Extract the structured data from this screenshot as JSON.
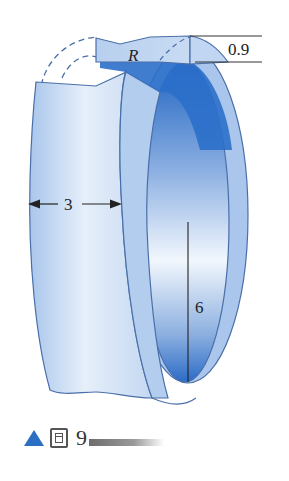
{
  "figure": {
    "labels": {
      "radius": "R",
      "thickness": "0.9",
      "width": "3",
      "height": "6"
    },
    "colors": {
      "outer_surface_light": "#e9f1fb",
      "outer_surface_mid": "#b9d0ee",
      "rim": "#a9c5eb",
      "inner_dark": "#2b6fca",
      "inner_light": "#eef4fc",
      "outline": "#4a6fa8",
      "caption_triangle": "#2a6fc4"
    }
  },
  "caption": {
    "number": "9"
  }
}
